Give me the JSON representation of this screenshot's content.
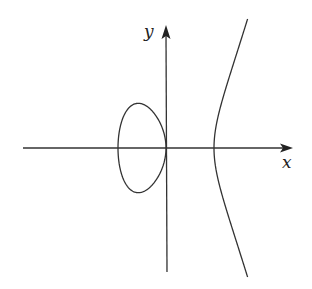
{
  "diagram": {
    "type": "elliptic-curve-plot",
    "equation_shape": "y^2 = x^3 - x",
    "axes": {
      "x_label": "x",
      "y_label": "y"
    },
    "components": [
      {
        "name": "oval",
        "x_range": [
          -1,
          0
        ]
      },
      {
        "name": "unbounded-branch",
        "x_start": 1
      }
    ],
    "colors": {
      "stroke": "#333333",
      "background": "#ffffff"
    }
  }
}
